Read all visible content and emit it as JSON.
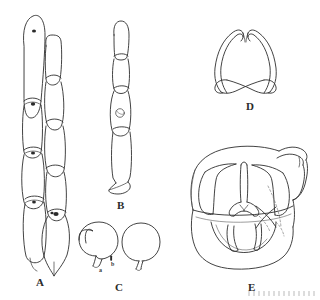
{
  "plate": {
    "title": "Taxonomic line-drawing plate",
    "background_color": "#ffffff",
    "ink_color": "#2e2e2e",
    "width": 320,
    "height": 300,
    "figures": [
      {
        "key": "A",
        "label": "A",
        "label_x": 36,
        "label_y": 276,
        "caption": "Two chains of catenulate cells with septa and dark clamp bodies; right chain terminating in a pointed lemon-shaped cell",
        "elements": [
          {
            "name": "left-hyphal-chain",
            "cells": 5,
            "markers": 3
          },
          {
            "name": "right-hyphal-chain",
            "cells": 5,
            "markers": 1
          },
          {
            "name": "terminal-pointed-cell",
            "cells": 1
          }
        ]
      },
      {
        "key": "B",
        "label": "B",
        "label_x": 117,
        "label_y": 199,
        "caption": "Single chain of elongate cells with a circular clamp connection, ending in a triangular pointed apex",
        "elements": [
          {
            "name": "cell-chain",
            "cells": 4,
            "markers": 1
          },
          {
            "name": "triangular-tip",
            "cells": 1
          }
        ]
      },
      {
        "key": "C",
        "label": "C",
        "label_x": 115,
        "label_y": 281,
        "caption": "Two ovoid to pyriform spores with basal apiculus",
        "sub_labels": [
          {
            "text": "a",
            "x": 99,
            "y": 267
          },
          {
            "text": "b",
            "x": 111,
            "y": 261
          }
        ],
        "elements": [
          {
            "name": "spore-left"
          },
          {
            "name": "spore-right"
          }
        ]
      },
      {
        "key": "D",
        "label": "D",
        "label_x": 246,
        "label_y": 100,
        "caption": "Paired crossed filiform appendages forming a looped heart-shaped outline",
        "elements": [
          {
            "name": "crossed-appendage-pair"
          }
        ]
      },
      {
        "key": "E",
        "label": "E",
        "label_x": 248,
        "label_y": 281,
        "caption": "Ventral view of genital capsule with lateral lobes, median column, paired inner plates and curved dorsal hook; dotted lines show hidden margins",
        "elements": [
          {
            "name": "outer-capsule-outline"
          },
          {
            "name": "left-lateral-lobe"
          },
          {
            "name": "right-lateral-lobe"
          },
          {
            "name": "median-column"
          },
          {
            "name": "basal-plate"
          },
          {
            "name": "dorsal-hook-appendage"
          },
          {
            "name": "hidden-margin-dotted"
          }
        ]
      }
    ]
  }
}
